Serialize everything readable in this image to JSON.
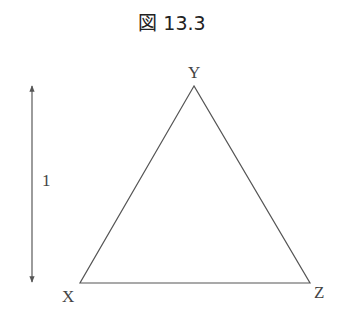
{
  "figure": {
    "title": "図 13.3"
  },
  "diagram": {
    "shape": "equilateral triangle",
    "vertices": [
      {
        "label": "Y",
        "position": "top"
      },
      {
        "label": "X",
        "position": "bottom-left"
      },
      {
        "label": "Z",
        "position": "bottom-right"
      }
    ],
    "dimension_arrow": {
      "label": "1",
      "orientation": "vertical",
      "meaning": "height"
    }
  },
  "colors": {
    "line": "#555555",
    "text": "#444444"
  }
}
